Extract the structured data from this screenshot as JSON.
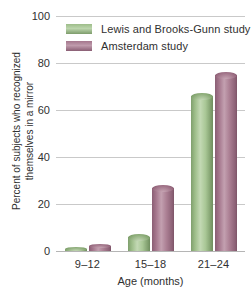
{
  "chart_data": {
    "type": "bar",
    "title": "",
    "categories": [
      "9–12",
      "15–18",
      "21–24"
    ],
    "series": [
      {
        "name": "Lewis and Brooks-Gunn study",
        "color": "#92b57e",
        "values": [
          1,
          6,
          66
        ]
      },
      {
        "name": "Amsterdam study",
        "color": "#9b6d84",
        "values": [
          2,
          27,
          75
        ]
      }
    ],
    "xlabel": "Age (months)",
    "ylabel": "Percent of subjects who recognized themselves in a mirror",
    "ylim": [
      0,
      100
    ],
    "yticks": [
      0,
      20,
      40,
      60,
      80,
      100
    ],
    "ytick_labels": [
      "0",
      "20",
      "40",
      "60",
      "80",
      "100"
    ],
    "grid": true,
    "legend_position": "top-left-inside"
  },
  "axes": {
    "y_title_line1": "Percent of subjects who recognized",
    "y_title_line2": "themselves in a mirror",
    "x_title": "Age (months)"
  },
  "legend": {
    "entries": [
      {
        "label": "Lewis and Brooks-Gunn study",
        "swatch": "green"
      },
      {
        "label": "Amsterdam study",
        "swatch": "purple"
      }
    ]
  },
  "colors": {
    "green": "#92b57e",
    "purple": "#9b6d84",
    "gridline": "#c9c9c9",
    "text": "#303030",
    "background": "#ffffff"
  }
}
